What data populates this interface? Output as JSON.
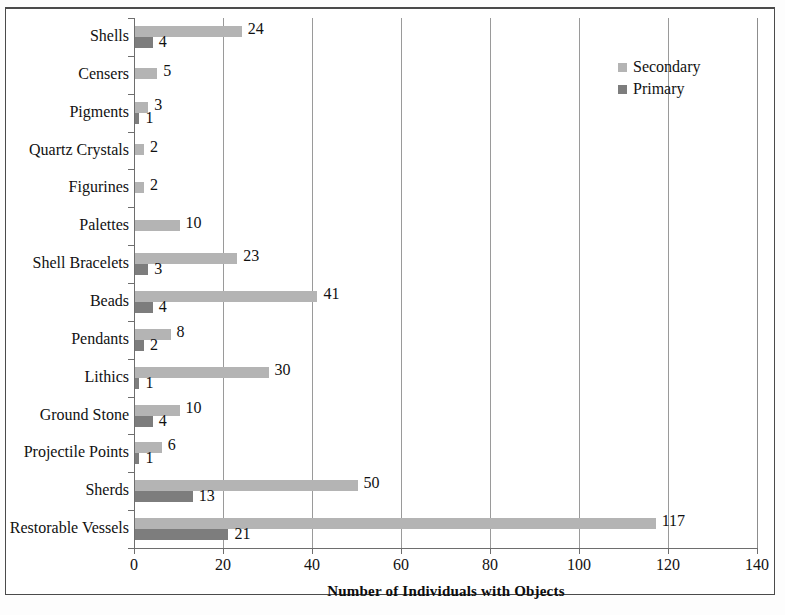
{
  "chart_data": {
    "type": "bar",
    "orientation": "horizontal",
    "title": "",
    "xlabel": "Number of Individuals with Objects",
    "ylabel": "",
    "xlim": [
      0,
      140
    ],
    "xticks": [
      0,
      20,
      40,
      60,
      80,
      100,
      120,
      140
    ],
    "grid": "vertical",
    "legend_position": "top-right",
    "categories": [
      "Shells",
      "Censers",
      "Pigments",
      "Quartz Crystals",
      "Figurines",
      "Palettes",
      "Shell Bracelets",
      "Beads",
      "Pendants",
      "Lithics",
      "Ground Stone",
      "Projectile Points",
      "Sherds",
      "Restorable Vessels"
    ],
    "series": [
      {
        "name": "Secondary",
        "color": "#b4b4b4",
        "values": [
          24,
          5,
          3,
          2,
          2,
          10,
          23,
          41,
          8,
          30,
          10,
          6,
          50,
          117
        ]
      },
      {
        "name": "Primary",
        "color": "#7d7d7d",
        "values": [
          4,
          null,
          1,
          null,
          null,
          null,
          3,
          4,
          2,
          1,
          4,
          1,
          13,
          21
        ]
      }
    ]
  },
  "legend": {
    "items": [
      {
        "label": "Secondary",
        "swatch": "secondary"
      },
      {
        "label": "Primary",
        "swatch": "primary"
      }
    ]
  },
  "axis": {
    "x_title": "Number of Individuals with Objects",
    "x_tick_labels": [
      "0",
      "20",
      "40",
      "60",
      "80",
      "100",
      "120",
      "140"
    ]
  }
}
